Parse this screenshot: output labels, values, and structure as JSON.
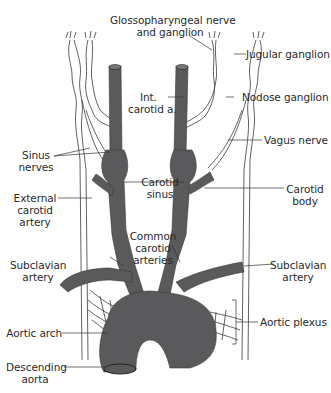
{
  "diagram": {
    "colors": {
      "artery": "#5a5a5c",
      "nerve_stroke": "#3a3a3a",
      "background": "#ffffff",
      "text": "#2a2a2a"
    },
    "labels": {
      "glossopharyngeal_1": "Glossopharyngeal nerve",
      "glossopharyngeal_2": "and ganglion",
      "jugular_ganglion": "Jugular ganglion",
      "nodose_ganglion": "Nodose ganglion",
      "int_carotid_1": "Int.",
      "int_carotid_2": "carotid a.",
      "vagus_nerve": "Vagus nerve",
      "sinus_nerves_1": "Sinus",
      "sinus_nerves_2": "nerves",
      "carotid_sinus_1": "Carotid",
      "carotid_sinus_2": "sinus",
      "carotid_body_1": "Carotid",
      "carotid_body_2": "body",
      "external_carotid_1": "External",
      "external_carotid_2": "carotid",
      "external_carotid_3": "artery",
      "common_carotid_1": "Common",
      "common_carotid_2": "carotid",
      "common_carotid_3": "arteries",
      "subclavian_left_1": "Subclavian",
      "subclavian_left_2": "artery",
      "subclavian_right_1": "Subclavian",
      "subclavian_right_2": "artery",
      "aortic_arch": "Aortic arch",
      "aortic_plexus": "Aortic plexus",
      "descending_aorta_1": "Descending",
      "descending_aorta_2": "aorta"
    }
  }
}
